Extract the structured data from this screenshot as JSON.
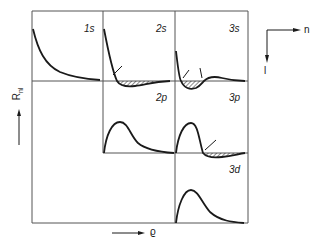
{
  "figure": {
    "y_axis_label": "R",
    "y_axis_label_sub": "nl",
    "x_axis_label": "ϱ",
    "orientation_axes": {
      "horizontal": "n",
      "vertical": "l"
    },
    "panels": [
      {
        "id": "1s",
        "label": "1s",
        "row": 0,
        "col": 0,
        "nodes": 0
      },
      {
        "id": "2s",
        "label": "2s",
        "row": 0,
        "col": 1,
        "nodes": 1
      },
      {
        "id": "3s",
        "label": "3s",
        "row": 0,
        "col": 2,
        "nodes": 2
      },
      {
        "id": "2p",
        "label": "2p",
        "row": 1,
        "col": 1,
        "nodes": 0
      },
      {
        "id": "3p",
        "label": "3p",
        "row": 1,
        "col": 2,
        "nodes": 1
      },
      {
        "id": "3d",
        "label": "3d",
        "row": 2,
        "col": 2,
        "nodes": 0
      }
    ],
    "colors": {
      "ink": "#1a1a1a",
      "grid": "#555555",
      "background": "#ffffff"
    }
  }
}
